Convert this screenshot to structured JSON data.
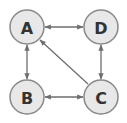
{
  "diagram": {
    "type": "directed-graph",
    "nodes": [
      {
        "id": "A",
        "label": "A",
        "x": 27,
        "y": 27
      },
      {
        "id": "D",
        "label": "D",
        "x": 101,
        "y": 27
      },
      {
        "id": "B",
        "label": "B",
        "x": 27,
        "y": 97
      },
      {
        "id": "C",
        "label": "C",
        "x": 101,
        "y": 97
      }
    ],
    "edges": [
      {
        "from": "A",
        "to": "D",
        "bidirectional": true
      },
      {
        "from": "A",
        "to": "B",
        "bidirectional": true
      },
      {
        "from": "B",
        "to": "C",
        "bidirectional": true
      },
      {
        "from": "D",
        "to": "C",
        "bidirectional": true
      },
      {
        "from": "C",
        "to": "A",
        "bidirectional": false
      }
    ],
    "colors": {
      "node_fill": "#e8e8e8",
      "node_stroke": "#8a8a8a",
      "edge": "#6e6e6e",
      "label": "#333333"
    }
  }
}
